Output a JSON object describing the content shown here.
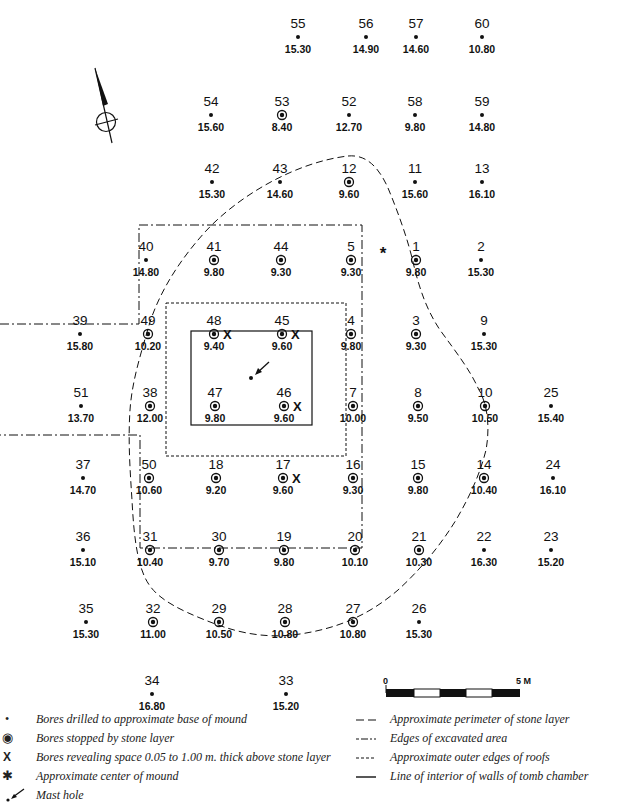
{
  "bores": [
    {
      "id": "55",
      "depth": "15.30",
      "type": "base",
      "x": 298,
      "y": 27
    },
    {
      "id": "56",
      "depth": "14.90",
      "type": "base",
      "x": 366,
      "y": 27
    },
    {
      "id": "57",
      "depth": "14.60",
      "type": "base",
      "x": 416,
      "y": 27
    },
    {
      "id": "60",
      "depth": "10.80",
      "type": "base",
      "x": 482,
      "y": 27
    },
    {
      "id": "54",
      "depth": "15.60",
      "type": "base",
      "x": 211,
      "y": 105
    },
    {
      "id": "53",
      "depth": "8.40",
      "type": "stone",
      "x": 282,
      "y": 105
    },
    {
      "id": "52",
      "depth": "12.70",
      "type": "base",
      "x": 349,
      "y": 105
    },
    {
      "id": "58",
      "depth": "9.80",
      "type": "base",
      "x": 415,
      "y": 105
    },
    {
      "id": "59",
      "depth": "14.80",
      "type": "base",
      "x": 482,
      "y": 105
    },
    {
      "id": "42",
      "depth": "15.30",
      "type": "base",
      "x": 212,
      "y": 172
    },
    {
      "id": "43",
      "depth": "14.60",
      "type": "base",
      "x": 280,
      "y": 172
    },
    {
      "id": "12",
      "depth": "9.60",
      "type": "stone",
      "x": 349,
      "y": 172
    },
    {
      "id": "11",
      "depth": "15.60",
      "type": "base",
      "x": 415,
      "y": 172
    },
    {
      "id": "13",
      "depth": "16.10",
      "type": "base",
      "x": 482,
      "y": 172
    },
    {
      "id": "40",
      "depth": "14.80",
      "type": "base",
      "x": 146,
      "y": 250
    },
    {
      "id": "41",
      "depth": "9.80",
      "type": "stone",
      "x": 214,
      "y": 250
    },
    {
      "id": "44",
      "depth": "9.30",
      "type": "stone",
      "x": 281,
      "y": 250
    },
    {
      "id": "5",
      "depth": "9.30",
      "type": "stone",
      "x": 351,
      "y": 250
    },
    {
      "id": "1",
      "depth": "9.80",
      "type": "stone",
      "x": 416,
      "y": 250
    },
    {
      "id": "2",
      "depth": "15.30",
      "type": "base",
      "x": 481,
      "y": 250
    },
    {
      "id": "39",
      "depth": "15.80",
      "type": "base",
      "x": 80,
      "y": 324
    },
    {
      "id": "49",
      "depth": "10.20",
      "type": "stone",
      "x": 148,
      "y": 324
    },
    {
      "id": "48",
      "depth": "9.40",
      "type": "stone",
      "space": true,
      "x": 214,
      "y": 324
    },
    {
      "id": "45",
      "depth": "9.60",
      "type": "stone",
      "space": true,
      "x": 282,
      "y": 324
    },
    {
      "id": "4",
      "depth": "9.80",
      "type": "stone",
      "x": 351,
      "y": 324
    },
    {
      "id": "3",
      "depth": "9.30",
      "type": "stone",
      "x": 416,
      "y": 324
    },
    {
      "id": "9",
      "depth": "15.30",
      "type": "base",
      "x": 484,
      "y": 324
    },
    {
      "id": "51",
      "depth": "13.70",
      "type": "base",
      "x": 81,
      "y": 396
    },
    {
      "id": "38",
      "depth": "12.00",
      "type": "stone",
      "x": 150,
      "y": 396
    },
    {
      "id": "47",
      "depth": "9.80",
      "type": "stone",
      "x": 215,
      "y": 396
    },
    {
      "id": "46",
      "depth": "9.60",
      "type": "stone",
      "space": true,
      "x": 284,
      "y": 396
    },
    {
      "id": "7",
      "depth": "10.00",
      "type": "stone",
      "x": 353,
      "y": 396
    },
    {
      "id": "8",
      "depth": "9.50",
      "type": "stone",
      "x": 418,
      "y": 396
    },
    {
      "id": "10",
      "depth": "10.50",
      "type": "stone",
      "x": 485,
      "y": 396
    },
    {
      "id": "25",
      "depth": "15.40",
      "type": "base",
      "x": 551,
      "y": 396
    },
    {
      "id": "37",
      "depth": "14.70",
      "type": "base",
      "x": 83,
      "y": 468
    },
    {
      "id": "50",
      "depth": "10.60",
      "type": "stone",
      "x": 149,
      "y": 468
    },
    {
      "id": "18",
      "depth": "9.20",
      "type": "stone",
      "x": 216,
      "y": 468
    },
    {
      "id": "17",
      "depth": "9.60",
      "type": "stone",
      "space": true,
      "x": 283,
      "y": 468
    },
    {
      "id": "16",
      "depth": "9.30",
      "type": "stone",
      "x": 353,
      "y": 468
    },
    {
      "id": "15",
      "depth": "9.80",
      "type": "stone",
      "x": 418,
      "y": 468
    },
    {
      "id": "14",
      "depth": "10.40",
      "type": "stone",
      "x": 484,
      "y": 468
    },
    {
      "id": "24",
      "depth": "16.10",
      "type": "base",
      "x": 553,
      "y": 468
    },
    {
      "id": "36",
      "depth": "15.10",
      "type": "base",
      "x": 83,
      "y": 540
    },
    {
      "id": "31",
      "depth": "10.40",
      "type": "stone",
      "x": 150,
      "y": 540
    },
    {
      "id": "30",
      "depth": "9.70",
      "type": "stone",
      "x": 219,
      "y": 540
    },
    {
      "id": "19",
      "depth": "9.80",
      "type": "stone",
      "x": 284,
      "y": 540
    },
    {
      "id": "20",
      "depth": "10.10",
      "type": "stone",
      "x": 355,
      "y": 540
    },
    {
      "id": "21",
      "depth": "10.30",
      "type": "stone",
      "x": 419,
      "y": 540
    },
    {
      "id": "22",
      "depth": "16.30",
      "type": "base",
      "x": 484,
      "y": 540
    },
    {
      "id": "23",
      "depth": "15.20",
      "type": "base",
      "x": 551,
      "y": 540
    },
    {
      "id": "35",
      "depth": "15.30",
      "type": "base",
      "x": 86,
      "y": 612
    },
    {
      "id": "32",
      "depth": "11.00",
      "type": "stone",
      "x": 153,
      "y": 612
    },
    {
      "id": "29",
      "depth": "10.50",
      "type": "stone",
      "x": 219,
      "y": 612
    },
    {
      "id": "28",
      "depth": "10.80",
      "type": "stone",
      "x": 285,
      "y": 612
    },
    {
      "id": "27",
      "depth": "10.80",
      "type": "stone",
      "x": 353,
      "y": 612
    },
    {
      "id": "26",
      "depth": "15.30",
      "type": "base",
      "x": 419,
      "y": 612
    },
    {
      "id": "34",
      "depth": "16.80",
      "type": "base",
      "x": 152,
      "y": 684
    },
    {
      "id": "33",
      "depth": "15.20",
      "type": "base",
      "x": 286,
      "y": 684
    }
  ],
  "center_of_mound_symbol": "*",
  "scale": {
    "start_label": "0",
    "end_label": "5 M"
  },
  "legend": {
    "left": [
      {
        "symbol": "dot",
        "label": "Bores drilled to approximate base of mound"
      },
      {
        "symbol": "ring-dot",
        "label": "Bores stopped by stone layer"
      },
      {
        "symbol": "X",
        "label": "Bores revealing space 0.05 to 1.00 m. thick above stone layer"
      },
      {
        "symbol": "asterisk",
        "label": "Approximate center of mound"
      },
      {
        "symbol": "arrow",
        "label": "Mast hole"
      }
    ],
    "right": [
      {
        "symbol": "long-dash",
        "label": "Approximate perimeter of stone layer"
      },
      {
        "symbol": "dash-dot",
        "label": "Edges of excavated area"
      },
      {
        "symbol": "short-dash",
        "label": "Approximate outer edges of roofs"
      },
      {
        "symbol": "solid",
        "label": "Line of interior of walls of tomb chamber"
      }
    ]
  },
  "legend_symbols": {
    "dot": "•",
    "ring": "◉",
    "x": "X",
    "asterisk": "✱",
    "long_dash": "— —",
    "dash_dot": "-—·",
    "short_dash": "----",
    "solid": "——"
  }
}
